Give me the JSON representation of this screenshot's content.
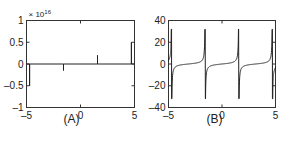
{
  "chart_data": [
    {
      "type": "line",
      "caption": "(A)",
      "title": "",
      "xlabel": "",
      "ylabel": "",
      "y_multiplier": "× 10^16",
      "y_multiplier_base": "× 10",
      "y_multiplier_exp": "16",
      "xlim": [
        -5,
        5
      ],
      "ylim": [
        -1,
        1
      ],
      "xticks": [
        "-5",
        "0",
        "5"
      ],
      "yticks": [
        "1",
        "0.5",
        "0",
        "-0.5",
        "-1"
      ],
      "grid": false,
      "description": "Near-zero residual with spikes at tan asymptotes (±π/2, ±3π/2)",
      "series": [
        {
          "name": "residual",
          "x": [
            -5,
            -4.712,
            -4.712,
            -4.712,
            -1.571,
            -1.571,
            -1.571,
            1.571,
            1.571,
            1.571,
            4.712,
            4.712,
            4.712,
            5
          ],
          "values": [
            0,
            0,
            -0.5,
            0,
            0,
            -0.15,
            0,
            0,
            0.2,
            0,
            0,
            0.5,
            0,
            0
          ]
        }
      ]
    },
    {
      "type": "line",
      "caption": "(B)",
      "title": "",
      "xlabel": "",
      "ylabel": "",
      "xlim": [
        -5,
        5
      ],
      "ylim": [
        -40,
        40
      ],
      "xticks": [
        "-5",
        "0",
        "5"
      ],
      "yticks": [
        "40",
        "20",
        "0",
        "-20",
        "-40"
      ],
      "grid": false,
      "description": "tan(x) over [-5, 5], clipped near ±32",
      "series": [
        {
          "name": "tan(x)",
          "function": "tan",
          "asymptotes": [
            -4.712,
            -1.571,
            1.571,
            4.712
          ],
          "clip": 32
        }
      ]
    }
  ]
}
